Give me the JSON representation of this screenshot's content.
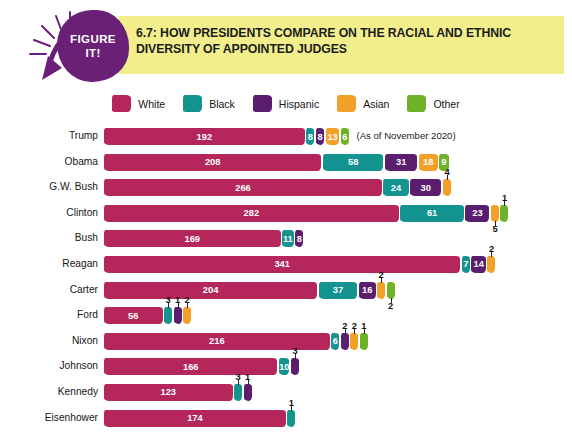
{
  "figure": {
    "badge_line1": "FIGURE",
    "badge_line2": "IT!",
    "title": "6.7: HOW PRESIDENTS COMPARE ON THE RACIAL AND ETHNIC DIVERSITY OF APPOINTED JUDGES",
    "annotation": "(As of November 2020)",
    "banner_color": "#F2EE8C",
    "badge_color": "#6B2078"
  },
  "legend": {
    "items": [
      {
        "label": "White",
        "color": "#B5265A"
      },
      {
        "label": "Black",
        "color": "#149490"
      },
      {
        "label": "Hispanic",
        "color": "#5B1E6E"
      },
      {
        "label": "Asian",
        "color": "#F2A028"
      },
      {
        "label": "Other",
        "color": "#6FB22A"
      }
    ]
  },
  "chart_data": {
    "type": "bar",
    "orientation": "horizontal",
    "stacked": true,
    "title": "6.7: HOW PRESIDENTS COMPARE ON THE RACIAL AND ETHNIC DIVERSITY OF APPOINTED JUDGES",
    "xlabel": "",
    "ylabel": "",
    "grid": false,
    "legend_position": "top",
    "categories": [
      "Trump",
      "Obama",
      "G.W. Bush",
      "Clinton",
      "Bush",
      "Reagan",
      "Carter",
      "Ford",
      "Nixon",
      "Johnson",
      "Kennedy",
      "Eisenhower"
    ],
    "series": [
      {
        "name": "White",
        "color": "#B5265A",
        "values": [
          192,
          208,
          266,
          282,
          169,
          341,
          204,
          56,
          216,
          166,
          123,
          174
        ]
      },
      {
        "name": "Black",
        "color": "#149490",
        "values": [
          8,
          58,
          24,
          61,
          11,
          7,
          37,
          3,
          6,
          10,
          3,
          1
        ]
      },
      {
        "name": "Hispanic",
        "color": "#5B1E6E",
        "values": [
          8,
          31,
          30,
          23,
          8,
          14,
          16,
          1,
          2,
          3,
          1,
          0
        ]
      },
      {
        "name": "Asian",
        "color": "#F2A028",
        "values": [
          13,
          18,
          4,
          5,
          0,
          2,
          2,
          2,
          2,
          0,
          0,
          0
        ]
      },
      {
        "name": "Other",
        "color": "#6FB22A",
        "values": [
          6,
          9,
          0,
          1,
          0,
          0,
          2,
          0,
          1,
          0,
          0,
          0
        ]
      }
    ]
  },
  "rows": [
    {
      "label": "Trump",
      "annotation": "(As of November 2020)",
      "segments": [
        {
          "series": "White",
          "value": 192,
          "inside": true
        },
        {
          "series": "Black",
          "value": 8,
          "inside": true
        },
        {
          "series": "Hispanic",
          "value": 8,
          "inside": true
        },
        {
          "series": "Asian",
          "value": 13,
          "inside": true
        },
        {
          "series": "Other",
          "value": 6,
          "inside": true
        }
      ]
    },
    {
      "label": "Obama",
      "segments": [
        {
          "series": "White",
          "value": 208,
          "inside": true
        },
        {
          "series": "Black",
          "value": 58,
          "inside": true
        },
        {
          "series": "Hispanic",
          "value": 31,
          "inside": true
        },
        {
          "series": "Asian",
          "value": 18,
          "inside": true
        },
        {
          "series": "Other",
          "value": 9,
          "inside": true
        }
      ]
    },
    {
      "label": "G.W. Bush",
      "segments": [
        {
          "series": "White",
          "value": 266,
          "inside": true
        },
        {
          "series": "Black",
          "value": 24,
          "inside": true
        },
        {
          "series": "Hispanic",
          "value": 30,
          "inside": true
        },
        {
          "series": "Asian",
          "value": 4,
          "inside": false,
          "callout": "above"
        }
      ]
    },
    {
      "label": "Clinton",
      "segments": [
        {
          "series": "White",
          "value": 282,
          "inside": true
        },
        {
          "series": "Black",
          "value": 61,
          "inside": true
        },
        {
          "series": "Hispanic",
          "value": 23,
          "inside": true
        },
        {
          "series": "Asian",
          "value": 5,
          "inside": false,
          "callout": "below"
        },
        {
          "series": "Other",
          "value": 1,
          "inside": false,
          "callout": "above"
        }
      ]
    },
    {
      "label": "Bush",
      "segments": [
        {
          "series": "White",
          "value": 169,
          "inside": true
        },
        {
          "series": "Black",
          "value": 11,
          "inside": true
        },
        {
          "series": "Hispanic",
          "value": 8,
          "inside": true
        }
      ]
    },
    {
      "label": "Reagan",
      "segments": [
        {
          "series": "White",
          "value": 341,
          "inside": true
        },
        {
          "series": "Black",
          "value": 7,
          "inside": true
        },
        {
          "series": "Hispanic",
          "value": 14,
          "inside": true
        },
        {
          "series": "Asian",
          "value": 2,
          "inside": false,
          "callout": "above"
        }
      ]
    },
    {
      "label": "Carter",
      "segments": [
        {
          "series": "White",
          "value": 204,
          "inside": true
        },
        {
          "series": "Black",
          "value": 37,
          "inside": true
        },
        {
          "series": "Hispanic",
          "value": 16,
          "inside": true
        },
        {
          "series": "Asian",
          "value": 2,
          "inside": false,
          "callout": "above"
        },
        {
          "series": "Other",
          "value": 2,
          "inside": false,
          "callout": "below"
        }
      ]
    },
    {
      "label": "Ford",
      "segments": [
        {
          "series": "White",
          "value": 56,
          "inside": true
        },
        {
          "series": "Black",
          "value": 3,
          "inside": false,
          "callout": "above"
        },
        {
          "series": "Hispanic",
          "value": 1,
          "inside": false,
          "callout": "above"
        },
        {
          "series": "Asian",
          "value": 2,
          "inside": false,
          "callout": "above"
        }
      ]
    },
    {
      "label": "Nixon",
      "segments": [
        {
          "series": "White",
          "value": 216,
          "inside": true
        },
        {
          "series": "Black",
          "value": 6,
          "inside": true
        },
        {
          "series": "Hispanic",
          "value": 2,
          "inside": false,
          "callout": "above"
        },
        {
          "series": "Asian",
          "value": 2,
          "inside": false,
          "callout": "above"
        },
        {
          "series": "Other",
          "value": 1,
          "inside": false,
          "callout": "above"
        }
      ]
    },
    {
      "label": "Johnson",
      "segments": [
        {
          "series": "White",
          "value": 166,
          "inside": true
        },
        {
          "series": "Black",
          "value": 10,
          "inside": true
        },
        {
          "series": "Hispanic",
          "value": 3,
          "inside": false,
          "callout": "above"
        }
      ]
    },
    {
      "label": "Kennedy",
      "segments": [
        {
          "series": "White",
          "value": 123,
          "inside": true
        },
        {
          "series": "Black",
          "value": 3,
          "inside": false,
          "callout": "above"
        },
        {
          "series": "Hispanic",
          "value": 1,
          "inside": false,
          "callout": "above"
        }
      ]
    },
    {
      "label": "Eisenhower",
      "segments": [
        {
          "series": "White",
          "value": 174,
          "inside": true
        },
        {
          "series": "Black",
          "value": 1,
          "inside": false,
          "callout": "above"
        }
      ]
    }
  ]
}
